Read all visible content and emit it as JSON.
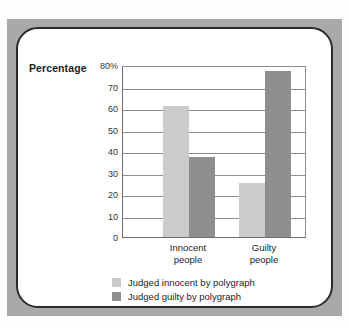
{
  "chart_data": {
    "type": "bar",
    "title": "",
    "xlabel": "",
    "ylabel": "Percentage",
    "ylim": [
      0,
      80
    ],
    "yticks": [
      "0",
      "10",
      "20",
      "30",
      "40",
      "50",
      "60",
      "70",
      "80%"
    ],
    "grid": true,
    "legend_position": "bottom",
    "categories": [
      "Innocent people",
      "Guilty people"
    ],
    "category_lines": [
      [
        "Innocent",
        "people"
      ],
      [
        "Guilty",
        "people"
      ]
    ],
    "series": [
      {
        "name": "Judged innocent by polygraph",
        "color": "#cacccc",
        "values": [
          61,
          25
        ]
      },
      {
        "name": "Judged guilty by polygraph",
        "color": "#8e9090",
        "values": [
          37,
          77
        ]
      }
    ]
  },
  "axis": {
    "y_caption": "Percentage"
  },
  "colors": {
    "frame_band": "#a9a9a9",
    "card_border": "#2b2b2b",
    "card_background": "#ffffff",
    "gridline": "#8c8c8c",
    "axis_line": "#6d6d6d",
    "text": "#1d1d1b"
  }
}
